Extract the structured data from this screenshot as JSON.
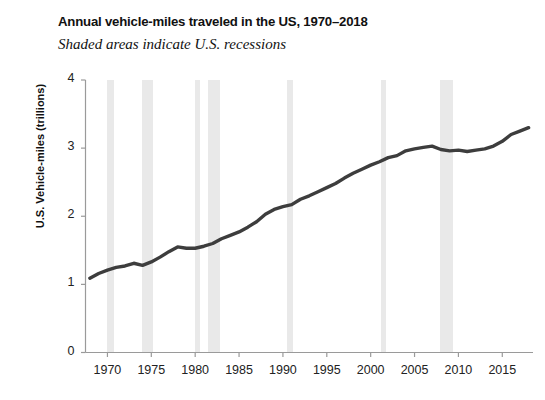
{
  "chart_data": {
    "type": "line",
    "title": "Annual vehicle-miles traveled in the US, 1970–2018",
    "subtitle": "Shaded areas indicate U.S. recessions",
    "xlabel": "",
    "ylabel": "U.S. Vehicle-miles (trillions)",
    "xlim": [
      1967.5,
      2018.5
    ],
    "ylim": [
      0,
      4
    ],
    "grid": false,
    "legend": null,
    "y_ticks": [
      0,
      1,
      2,
      3,
      4
    ],
    "y_tick_labels": [
      "0",
      "1",
      "2",
      "3",
      "4"
    ],
    "x_ticks": [
      1970,
      1975,
      1980,
      1985,
      1990,
      1995,
      2000,
      2005,
      2010,
      2015
    ],
    "x_tick_labels": [
      "1970",
      "1975",
      "1980",
      "1985",
      "1990",
      "1995",
      "2000",
      "2005",
      "2010",
      "2015"
    ],
    "line_color": "#3d3d3d",
    "line_width": 3.4,
    "band_color": "#e9e9e9",
    "axis_color": "#9a9a9a",
    "series": [
      {
        "name": "U.S. Vehicle-miles traveled",
        "x": [
          1968,
          1969,
          1970,
          1971,
          1972,
          1973,
          1974,
          1975,
          1976,
          1977,
          1978,
          1979,
          1980,
          1981,
          1982,
          1983,
          1984,
          1985,
          1986,
          1987,
          1988,
          1989,
          1990,
          1991,
          1992,
          1993,
          1994,
          1995,
          1996,
          1997,
          1998,
          1999,
          2000,
          2001,
          2002,
          2003,
          2004,
          2005,
          2006,
          2007,
          2008,
          2009,
          2010,
          2011,
          2012,
          2013,
          2014,
          2015,
          2016,
          2017,
          2018
        ],
        "values": [
          1.09,
          1.16,
          1.21,
          1.25,
          1.27,
          1.31,
          1.28,
          1.33,
          1.4,
          1.48,
          1.55,
          1.53,
          1.53,
          1.56,
          1.6,
          1.67,
          1.72,
          1.77,
          1.84,
          1.92,
          2.03,
          2.1,
          2.14,
          2.17,
          2.25,
          2.3,
          2.36,
          2.42,
          2.48,
          2.56,
          2.63,
          2.69,
          2.75,
          2.8,
          2.86,
          2.89,
          2.96,
          2.99,
          3.01,
          3.03,
          2.98,
          2.96,
          2.97,
          2.95,
          2.97,
          2.99,
          3.03,
          3.1,
          3.2,
          3.25,
          3.3
        ]
      }
    ],
    "recessions": [
      {
        "label": "1969–1970 recession",
        "start": 1969.9,
        "end": 1970.8
      },
      {
        "label": "1973–1975 recession",
        "start": 1973.9,
        "end": 1975.2
      },
      {
        "label": "1980 recession",
        "start": 1980.0,
        "end": 1980.5
      },
      {
        "label": "1981–1982 recession",
        "start": 1981.5,
        "end": 1982.8
      },
      {
        "label": "1990–1991 recession",
        "start": 1990.5,
        "end": 1991.2
      },
      {
        "label": "2001 recession",
        "start": 2001.2,
        "end": 2001.8
      },
      {
        "label": "2007–2009 recession",
        "start": 2007.9,
        "end": 2009.4
      }
    ]
  }
}
